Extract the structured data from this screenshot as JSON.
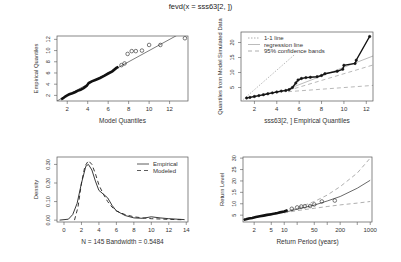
{
  "title": "fevd(x = sss63[2, ])",
  "chart_data": [
    {
      "id": "qq1",
      "type": "scatter",
      "title": "",
      "xlabel": "Model Quantiles",
      "ylabel": "Empirical Quantiles",
      "frame": {
        "x": 57,
        "y": 36,
        "w": 131,
        "h": 65
      },
      "xlim": [
        1.0,
        13.8
      ],
      "ylim": [
        1.0,
        12.6
      ],
      "xticks": [
        2,
        4,
        6,
        8,
        10,
        12
      ],
      "yticks": [
        2,
        4,
        6,
        8,
        10,
        12
      ],
      "reference_line": {
        "style": "solid",
        "points": [
          [
            1.0,
            1.0
          ],
          [
            13.8,
            13.8
          ]
        ]
      },
      "points_dense": [
        [
          1.4,
          1.3
        ],
        [
          1.6,
          1.5
        ],
        [
          1.8,
          1.8
        ],
        [
          2.0,
          2.0
        ],
        [
          2.2,
          2.2
        ],
        [
          2.5,
          2.4
        ],
        [
          2.8,
          2.6
        ],
        [
          3.0,
          2.8
        ],
        [
          3.3,
          3.0
        ],
        [
          3.6,
          3.3
        ],
        [
          3.9,
          3.7
        ],
        [
          4.1,
          4.2
        ],
        [
          4.4,
          4.5
        ],
        [
          4.8,
          4.8
        ],
        [
          5.2,
          5.1
        ],
        [
          5.6,
          5.5
        ],
        [
          6.0,
          5.9
        ],
        [
          6.4,
          6.3
        ],
        [
          6.8,
          6.9
        ],
        [
          7.0,
          7.1
        ]
      ],
      "points_open": [
        [
          7.3,
          7.4
        ],
        [
          7.6,
          7.7
        ],
        [
          7.9,
          9.4
        ],
        [
          8.3,
          9.9
        ],
        [
          8.7,
          9.9
        ],
        [
          9.3,
          10.0
        ],
        [
          10.0,
          11.0
        ],
        [
          11.1,
          11.0
        ],
        [
          13.5,
          12.2
        ]
      ]
    },
    {
      "id": "qq2",
      "type": "scatter",
      "title": "",
      "xlabel": "sss63[2, ] Empirical Quantiles",
      "ylabel": "Quantiles from Model Simulated Data",
      "frame": {
        "x": 241,
        "y": 32,
        "w": 132,
        "h": 69
      },
      "xlim": [
        0.8,
        12.6
      ],
      "ylim": [
        0.5,
        23.5
      ],
      "xticks": [
        2,
        4,
        6,
        8,
        10,
        12
      ],
      "yticks": [
        5,
        10,
        15,
        20
      ],
      "legend": [
        {
          "label": "1-1 line",
          "style": "dotted",
          "color": "#999999"
        },
        {
          "label": "regression line",
          "style": "solid",
          "color": "#aaaaaa"
        },
        {
          "label": "95% confidence bands",
          "style": "dashed",
          "color": "#999999"
        }
      ],
      "one_to_one_line": [
        [
          1.0,
          1.0
        ],
        [
          5.6,
          16.0
        ]
      ],
      "regression_line": [
        [
          5.0,
          4.5
        ],
        [
          12.6,
          15.5
        ]
      ],
      "upper_band": [
        [
          5.0,
          4.0
        ],
        [
          12.6,
          12.5
        ]
      ],
      "lower_band": [
        [
          5.0,
          3.6
        ],
        [
          12.6,
          5.7
        ]
      ],
      "points": [
        [
          1.3,
          1.5
        ],
        [
          1.6,
          1.7
        ],
        [
          2.0,
          2.0
        ],
        [
          2.4,
          2.3
        ],
        [
          2.8,
          2.6
        ],
        [
          3.2,
          2.9
        ],
        [
          3.6,
          3.2
        ],
        [
          4.0,
          3.5
        ],
        [
          4.4,
          3.8
        ],
        [
          4.8,
          4.0
        ],
        [
          5.1,
          4.3
        ],
        [
          5.4,
          5.0
        ],
        [
          5.7,
          6.5
        ],
        [
          5.9,
          7.5
        ],
        [
          6.2,
          8.0
        ],
        [
          6.6,
          8.3
        ],
        [
          7.0,
          8.4
        ],
        [
          7.6,
          8.6
        ],
        [
          8.0,
          9.0
        ],
        [
          8.3,
          9.6
        ],
        [
          9.4,
          10.4
        ],
        [
          9.9,
          11.1
        ],
        [
          10.0,
          12.4
        ],
        [
          11.0,
          13.0
        ],
        [
          11.1,
          14.1
        ],
        [
          12.3,
          22.0
        ]
      ]
    },
    {
      "id": "density",
      "type": "line",
      "title": "",
      "xlabel": "N = 145   Bandwidth = 0.5484",
      "ylabel": "Density",
      "frame": {
        "x": 57,
        "y": 157,
        "w": 131,
        "h": 65
      },
      "xlim": [
        -0.8,
        14.2
      ],
      "ylim": [
        -0.01,
        0.34
      ],
      "xticks": [
        0,
        2,
        4,
        6,
        8,
        10,
        12,
        14
      ],
      "yticks": [
        0.0,
        0.1,
        0.2,
        0.3
      ],
      "ytick_labels": [
        "0.00",
        "0.10",
        "0.20",
        "0.30"
      ],
      "legend": [
        {
          "label": "Empirical",
          "style": "solid"
        },
        {
          "label": "Modeled",
          "style": "dashed"
        }
      ],
      "series": [
        {
          "name": "Empirical",
          "style": "solid",
          "x": [
            -0.5,
            0.5,
            1.0,
            1.5,
            2.0,
            2.5,
            2.8,
            3.2,
            3.6,
            4.0,
            4.5,
            5.0,
            5.5,
            6.0,
            7.0,
            8.0,
            9.0,
            10.0,
            11.0,
            12.0,
            13.0,
            13.8
          ],
          "values": [
            0.0,
            0.005,
            0.03,
            0.09,
            0.2,
            0.29,
            0.3,
            0.27,
            0.21,
            0.16,
            0.14,
            0.12,
            0.08,
            0.05,
            0.025,
            0.012,
            0.01,
            0.018,
            0.012,
            0.008,
            0.005,
            0.003
          ]
        },
        {
          "name": "Modeled",
          "style": "dashed",
          "x": [
            1.2,
            1.6,
            2.0,
            2.4,
            2.8,
            3.2,
            3.6,
            4.0,
            4.5,
            5.0,
            5.5,
            6.0,
            7.0,
            8.0,
            9.0,
            10.0,
            11.0,
            12.0,
            13.0,
            13.8
          ],
          "values": [
            0.0,
            0.07,
            0.2,
            0.29,
            0.32,
            0.3,
            0.25,
            0.19,
            0.14,
            0.1,
            0.07,
            0.05,
            0.03,
            0.018,
            0.012,
            0.008,
            0.006,
            0.004,
            0.003,
            0.002
          ]
        }
      ]
    },
    {
      "id": "return_level",
      "type": "line",
      "title": "",
      "xlabel": "Return Period (years)",
      "ylabel": "Return Level",
      "frame": {
        "x": 243,
        "y": 157,
        "w": 129,
        "h": 65
      },
      "xscale": "log",
      "xlim": [
        1.1,
        1100
      ],
      "ylim": [
        2.0,
        30.5
      ],
      "xticks": [
        2,
        5,
        10,
        50,
        200,
        1000
      ],
      "xminor_ticks": [
        20,
        100,
        500
      ],
      "yticks": [
        5,
        10,
        15,
        20,
        25,
        30
      ],
      "series": [
        {
          "name": "Return level",
          "style": "solid",
          "x": [
            1.1,
            2,
            5,
            10,
            20,
            50,
            100,
            200,
            500,
            1000
          ],
          "values": [
            3.0,
            4.0,
            5.2,
            6.2,
            7.6,
            9.4,
            11.2,
            13.2,
            16.8,
            20.3
          ]
        },
        {
          "name": "Upper 95% CI",
          "style": "dashed",
          "x": [
            10,
            20,
            50,
            100,
            200,
            500,
            1000
          ],
          "values": [
            6.5,
            8.2,
            11.0,
            13.8,
            17.5,
            23.5,
            30.0
          ]
        },
        {
          "name": "Lower 95% CI",
          "style": "dashed",
          "x": [
            10,
            20,
            50,
            100,
            200,
            500,
            1000
          ],
          "values": [
            6.0,
            7.0,
            8.0,
            8.8,
            9.5,
            10.3,
            11.0
          ]
        }
      ],
      "points_dense": [
        [
          1.15,
          3.0
        ],
        [
          1.3,
          3.2
        ],
        [
          1.5,
          3.5
        ],
        [
          1.8,
          3.8
        ],
        [
          2.2,
          4.2
        ],
        [
          2.7,
          4.5
        ],
        [
          3.3,
          4.8
        ],
        [
          4.0,
          5.1
        ],
        [
          5.0,
          5.4
        ],
        [
          6.0,
          5.7
        ],
        [
          7.0,
          6.0
        ],
        [
          8.0,
          6.3
        ],
        [
          10.0,
          6.6
        ],
        [
          12.0,
          7.2
        ]
      ],
      "points_open": [
        [
          15,
          7.8
        ],
        [
          20,
          8.4
        ],
        [
          25,
          8.8
        ],
        [
          30,
          8.9
        ],
        [
          40,
          9.0
        ],
        [
          50,
          9.7
        ],
        [
          75,
          11.0
        ],
        [
          150,
          11.4
        ]
      ]
    }
  ]
}
